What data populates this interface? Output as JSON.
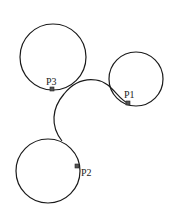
{
  "diagram": {
    "type": "tangent-circles-with-connecting-curve",
    "colors": {
      "stroke": "#1a1a1a",
      "marker": "#555555",
      "background": "#ffffff"
    },
    "circles": [
      {
        "id": "top-left",
        "cx": 53,
        "cy": 57,
        "r": 33
      },
      {
        "id": "right",
        "cx": 136,
        "cy": 79,
        "r": 27
      },
      {
        "id": "bottom",
        "cx": 48,
        "cy": 171,
        "r": 32
      }
    ],
    "points": [
      {
        "label": "P1",
        "x": 128,
        "y": 103,
        "label_x": 124,
        "label_y": 98
      },
      {
        "label": "P2",
        "x": 77,
        "y": 166,
        "label_x": 81,
        "label_y": 176
      },
      {
        "label": "P3",
        "x": 52,
        "y": 89,
        "label_x": 46,
        "label_y": 85
      }
    ],
    "curve_path": "M 128 103 C 118 100, 112 82, 96 80 C 82 78, 72 84, 64 94 C 52 108, 50 126, 62 141"
  }
}
